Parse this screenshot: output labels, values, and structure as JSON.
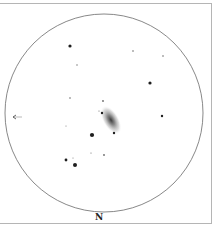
{
  "sketch": {
    "orientation_label": "N",
    "direction_arrow": "left-arrow",
    "field_circle": {
      "cx": 104,
      "cy": 113,
      "r": 99,
      "stroke": "#7a7a7a"
    },
    "galaxy": {
      "cx": 111,
      "cy": 120,
      "rx": 8,
      "ry": 16,
      "rotation": -30,
      "core_color": "#3a3a3a",
      "halo_color": "#bdbdbd"
    },
    "stars": [
      {
        "x": 70,
        "y": 46,
        "r": 1.6
      },
      {
        "x": 133,
        "y": 51,
        "r": 0.8
      },
      {
        "x": 163,
        "y": 56,
        "r": 0.8
      },
      {
        "x": 77,
        "y": 65,
        "r": 0.7
      },
      {
        "x": 150,
        "y": 83,
        "r": 1.6
      },
      {
        "x": 70,
        "y": 98,
        "r": 0.8
      },
      {
        "x": 103,
        "y": 101,
        "r": 0.9
      },
      {
        "x": 99,
        "y": 111,
        "r": 0.6
      },
      {
        "x": 102,
        "y": 113,
        "r": 1.2
      },
      {
        "x": 162,
        "y": 116,
        "r": 1.2
      },
      {
        "x": 66,
        "y": 126,
        "r": 0.5
      },
      {
        "x": 114,
        "y": 133,
        "r": 1.2
      },
      {
        "x": 92,
        "y": 135,
        "r": 2.1
      },
      {
        "x": 91,
        "y": 153,
        "r": 0.6
      },
      {
        "x": 104,
        "y": 155,
        "r": 0.9
      },
      {
        "x": 66,
        "y": 160,
        "r": 1.4
      },
      {
        "x": 73,
        "y": 158,
        "r": 0.5
      },
      {
        "x": 75,
        "y": 165,
        "r": 2.0
      }
    ]
  }
}
